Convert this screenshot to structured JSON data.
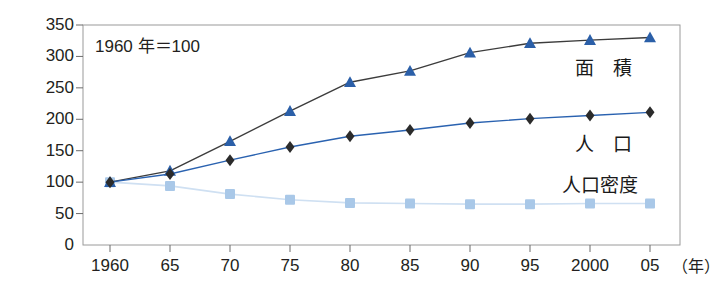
{
  "chart_data": {
    "type": "line",
    "title": "",
    "subtitle": "",
    "annotation": "1960 年＝100",
    "xlabel": "（年）",
    "ylabel": "",
    "categories": [
      "1960",
      "65",
      "70",
      "75",
      "80",
      "85",
      "90",
      "95",
      "2000",
      "05"
    ],
    "x_tick_labels": [
      "1960",
      "65",
      "70",
      "75",
      "80",
      "85",
      "90",
      "95",
      "2000",
      "05"
    ],
    "y_tick_labels": [
      "0",
      "50",
      "100",
      "150",
      "200",
      "250",
      "300",
      "350"
    ],
    "y_ticks": [
      0,
      50,
      100,
      150,
      200,
      250,
      300,
      350
    ],
    "ylim": [
      0,
      350
    ],
    "grid": false,
    "legend_position": "inline-right",
    "series": [
      {
        "name": "面　積",
        "marker": "triangle",
        "color": "#2b5fa8",
        "line_color": "#3c3c3c",
        "values": [
          100,
          118,
          165,
          213,
          259,
          277,
          306,
          321,
          326,
          330
        ]
      },
      {
        "name": "人　口",
        "marker": "diamond",
        "color": "#2b2b2b",
        "line_color": "#2a62b0",
        "values": [
          100,
          113,
          135,
          156,
          173,
          183,
          194,
          201,
          206,
          211
        ]
      },
      {
        "name": "人口密度",
        "marker": "square",
        "color": "#a9c8e8",
        "line_color": "#cfe0f2",
        "values": [
          100,
          94,
          81,
          72,
          67,
          66,
          65,
          65,
          66,
          66
        ]
      }
    ]
  },
  "labels": {
    "area": "面　積",
    "population": "人　口",
    "density": "人口密度",
    "note": "1960 年＝100",
    "year_unit": "（年）"
  },
  "colors": {
    "area_marker": "#2b5fa8",
    "area_line": "#3c3c3c",
    "population_marker": "#2b2b2b",
    "population_line": "#2a62b0",
    "density_marker": "#a9c8e8",
    "density_line": "#cfe0f2",
    "axis": "#8a8a8a",
    "text": "#231f20"
  }
}
